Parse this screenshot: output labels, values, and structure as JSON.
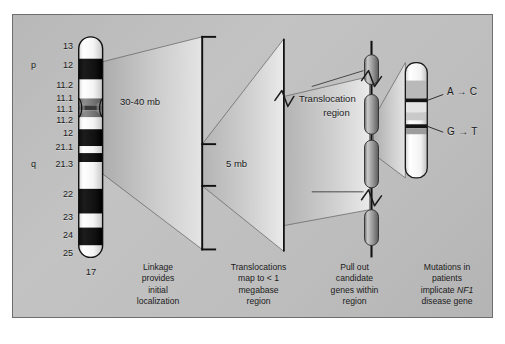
{
  "figure": {
    "background_color": "#bdbdbd",
    "border_color": "#6e6e6e"
  },
  "chromosome": {
    "name": "17",
    "number_label": "17",
    "arm_labels": {
      "p": "p",
      "q": "q"
    },
    "band_labels": [
      "13",
      "12",
      "11.2",
      "11.1",
      "11.1",
      "11.2",
      "12",
      "21.1",
      "21.3",
      "22",
      "23",
      "24",
      "25"
    ]
  },
  "panels": {
    "scale1": {
      "label": "30-40 mb"
    },
    "scale2": {
      "label": "5 mb"
    },
    "translocation": {
      "label_line1": "Translocation",
      "label_line2": "region"
    },
    "mutations": {
      "mutation1": "A → C",
      "mutation2": "G → T"
    }
  },
  "captions": [
    "Linkage\nprovides\ninitial\nlocalization",
    "Translocations\nmap to < 1\nmegabase\nregion",
    "Pull out\ncandidate\ngenes within\nregion",
    "Mutations in\npatients\nimplicate NF1\ndisease gene"
  ],
  "caption4_parts": {
    "line1": "Mutations in",
    "line2": "patients",
    "line3_pre": "implicate ",
    "line3_italic": "NF1",
    "line4": "disease gene"
  },
  "icons": {
    "arrow": "→",
    "zigzag_break": "zigzag-break-icon"
  }
}
